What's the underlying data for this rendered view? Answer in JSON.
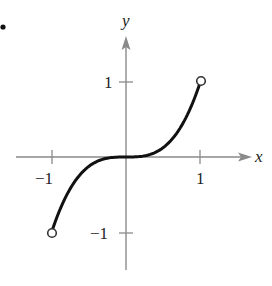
{
  "figure": {
    "bullet": "•",
    "x_axis_label": "x",
    "y_axis_label": "y",
    "tick_labels": {
      "x_neg1": "−1",
      "x_pos1": "1",
      "y_pos1": "1",
      "y_neg1": "−1"
    }
  },
  "chart_data": {
    "type": "line",
    "title": "",
    "function": "y = x^3",
    "xlabel": "x",
    "ylabel": "y",
    "xlim": [
      -1.5,
      1.7
    ],
    "ylim": [
      -1.5,
      1.6
    ],
    "x_ticks": [
      -1,
      1
    ],
    "y_ticks": [
      -1,
      1
    ],
    "grid": false,
    "series": [
      {
        "name": "f(x) = x^3",
        "x": [
          -1,
          -0.75,
          -0.5,
          -0.25,
          0,
          0.25,
          0.5,
          0.75,
          1
        ],
        "y": [
          -1,
          -0.422,
          -0.125,
          -0.016,
          0,
          0.016,
          0.125,
          0.422,
          1
        ]
      }
    ],
    "endpoints": [
      {
        "x": -1,
        "y": -1,
        "style": "open"
      },
      {
        "x": 1,
        "y": 1,
        "style": "open"
      }
    ],
    "colors": {
      "axis": "#8a8a8a",
      "curve": "#111111"
    }
  }
}
